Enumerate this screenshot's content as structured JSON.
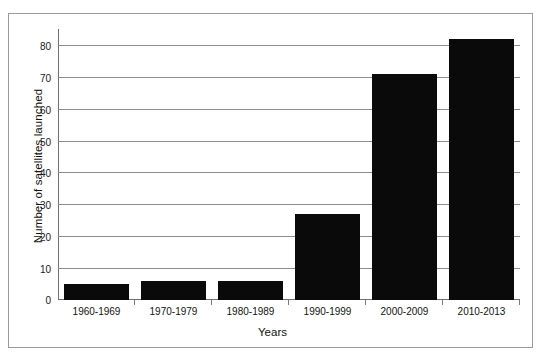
{
  "chart_data": {
    "type": "bar",
    "title": "",
    "subtitle": "",
    "xlabel": "Years",
    "ylabel": "Number of satellites launched",
    "categories": [
      "1960-1969",
      "1970-1979",
      "1980-1989",
      "1990-1999",
      "2000-2009",
      "2010-2013"
    ],
    "values": [
      5,
      6,
      6,
      27,
      71,
      82
    ],
    "series": [
      {
        "name": "Number of satellites launched",
        "values": [
          5,
          6,
          6,
          27,
          71,
          82
        ]
      }
    ],
    "ylim": [
      0,
      85
    ],
    "yticks": [
      0,
      10,
      20,
      30,
      40,
      50,
      60,
      70,
      80
    ],
    "ytick_labels": [
      "0",
      "10",
      "20",
      "30",
      "40",
      "50",
      "60",
      "70",
      "80"
    ],
    "grid": true,
    "grid_axis": "y",
    "legend": false,
    "legend_position": "none",
    "bar_color": "#0a0a0a",
    "gridline_color": "#8d8d8d",
    "axis_color": "#6f6f6f",
    "background_color": "#ffffff",
    "frame_border_color": "#9a9a9a",
    "annotations": []
  }
}
